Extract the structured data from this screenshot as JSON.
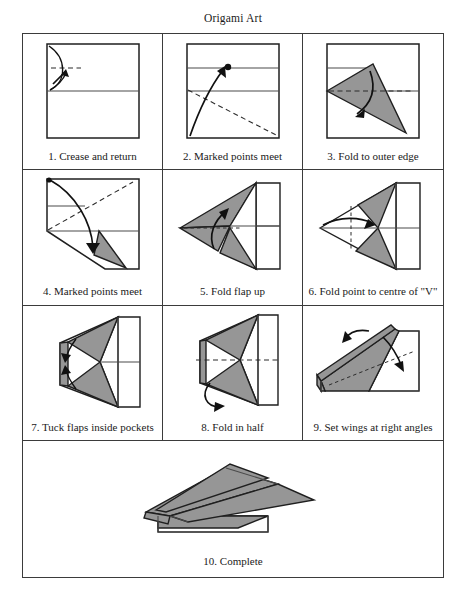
{
  "document": {
    "title": "Origami Art"
  },
  "diagram": {
    "fill_color": "#969696",
    "line_color": "#1f1f1f",
    "steps": [
      {
        "number": "1",
        "caption": "1. Crease and return",
        "label": "Crease and return"
      },
      {
        "number": "2",
        "caption": "2. Marked points meet",
        "label": "Marked points meet"
      },
      {
        "number": "3",
        "caption": "3. Fold to outer edge",
        "label": "Fold to outer edge"
      },
      {
        "number": "4",
        "caption": "4. Marked points meet",
        "label": "Marked points meet"
      },
      {
        "number": "5",
        "caption": "5. Fold flap up",
        "label": "Fold flap up"
      },
      {
        "number": "6",
        "caption": "6. Fold point to centre of \"V\"",
        "label": "Fold point to centre of V"
      },
      {
        "number": "7",
        "caption": "7. Tuck flaps inside pockets",
        "label": "Tuck flaps inside pockets"
      },
      {
        "number": "8",
        "caption": "8. Fold in half",
        "label": "Fold in half"
      },
      {
        "number": "9",
        "caption": "9. Set wings at right angles",
        "label": "Set wings at right angles"
      },
      {
        "number": "10",
        "caption": "10. Complete",
        "label": "Complete"
      }
    ]
  }
}
